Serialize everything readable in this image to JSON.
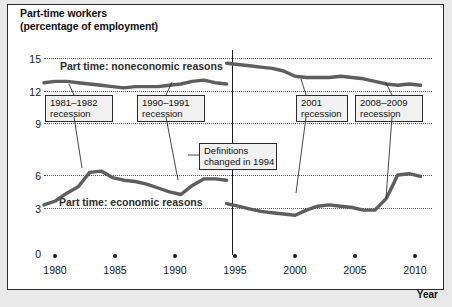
{
  "figure": {
    "title_line1": "Part-time workers",
    "title_line2": "(percentage of employment)",
    "xaxis_title": "Year"
  },
  "annotations": [
    {
      "name": "recession-1981-1982",
      "line1": "1981–1982",
      "line2": "recession"
    },
    {
      "name": "recession-1990-1991",
      "line1": "1990–1991",
      "line2": "recession"
    },
    {
      "name": "recession-2001",
      "line1": "2001",
      "line2": "recession"
    },
    {
      "name": "recession-2008-2009",
      "line1": "2008–2009",
      "line2": "recession"
    },
    {
      "name": "definitions-changed",
      "line1": "Definitions",
      "line2": "changed in 1994"
    }
  ],
  "chart_data": {
    "type": "line",
    "title": "Part-time workers (percentage of employment)",
    "xlabel": "Year",
    "ylabel": "",
    "xlim": [
      1978,
      2012
    ],
    "ylim": [
      0,
      15
    ],
    "yticks": [
      0,
      3,
      6,
      9,
      12,
      15
    ],
    "xticks": [
      1980,
      1985,
      1990,
      1995,
      2000,
      2005,
      2010
    ],
    "grid": "horizontal-dotted",
    "legend": "inline-labels",
    "line_color": "#5e5e5e",
    "series": [
      {
        "name": "Part time: noneconomic reasons",
        "label": "Part time: noneconomic reasons",
        "segments": [
          {
            "period": "pre-1994 definitions",
            "x": [
              1978,
              1979,
              1980,
              1981,
              1982,
              1983,
              1984,
              1985,
              1986,
              1987,
              1988,
              1989,
              1990,
              1991,
              1992,
              1993,
              1994
            ],
            "y": [
              13.1,
              13.2,
              13.2,
              13.1,
              13.0,
              12.9,
              12.8,
              12.7,
              12.8,
              12.8,
              12.8,
              12.9,
              13.0,
              13.2,
              13.3,
              13.1,
              13.0
            ]
          },
          {
            "period": "post-1994 definitions",
            "x": [
              1994,
              1995,
              1996,
              1997,
              1998,
              1999,
              2000,
              2001,
              2002,
              2003,
              2004,
              2005,
              2006,
              2007,
              2008,
              2009,
              2010,
              2011
            ],
            "y": [
              14.6,
              14.5,
              14.4,
              14.3,
              14.2,
              14.0,
              13.6,
              13.5,
              13.5,
              13.5,
              13.6,
              13.5,
              13.4,
              13.2,
              13.0,
              12.9,
              13.0,
              12.9
            ]
          }
        ]
      },
      {
        "name": "Part time: economic reasons",
        "label": "Part time: economic reasons",
        "segments": [
          {
            "period": "pre-1994 definitions",
            "x": [
              1978,
              1979,
              1980,
              1981,
              1982,
              1983,
              1984,
              1985,
              1986,
              1987,
              1988,
              1989,
              1990,
              1991,
              1992,
              1993,
              1994
            ],
            "y": [
              3.7,
              4.0,
              4.6,
              5.1,
              6.2,
              6.3,
              5.8,
              5.6,
              5.5,
              5.3,
              5.0,
              4.7,
              4.5,
              5.2,
              5.7,
              5.7,
              5.6
            ]
          },
          {
            "period": "post-1994 definitions",
            "x": [
              1994,
              1995,
              1996,
              1997,
              1998,
              1999,
              2000,
              2001,
              2002,
              2003,
              2004,
              2005,
              2006,
              2007,
              2008,
              2009,
              2010,
              2011
            ],
            "y": [
              3.8,
              3.6,
              3.4,
              3.2,
              3.1,
              3.0,
              2.9,
              3.3,
              3.6,
              3.7,
              3.6,
              3.5,
              3.3,
              3.3,
              4.2,
              6.0,
              6.1,
              5.9
            ]
          }
        ]
      }
    ],
    "events": [
      {
        "label": "1981–1982 recession",
        "start": 1981,
        "end": 1982
      },
      {
        "label": "1990–1991 recession",
        "start": 1990,
        "end": 1991
      },
      {
        "label": "2001 recession",
        "start": 2001,
        "end": 2001
      },
      {
        "label": "2008–2009 recession",
        "start": 2008,
        "end": 2009
      },
      {
        "label": "Definitions changed in 1994",
        "start": 1994,
        "end": 1994
      }
    ]
  }
}
